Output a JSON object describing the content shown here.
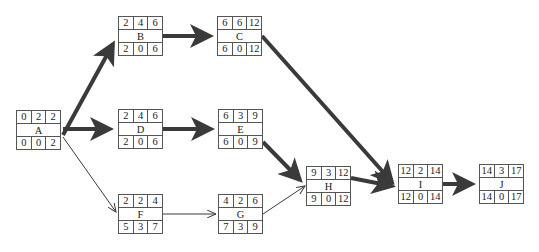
{
  "diagram": {
    "type": "activity-on-node network (critical path)",
    "cell_layout": {
      "top": [
        "ES",
        "Duration",
        "EF"
      ],
      "bottom": [
        "LS",
        "Slack",
        "LF"
      ]
    },
    "colors": {
      "line": "#3a3a3a",
      "critical_edge": "#3a3a3a",
      "border": "#555555",
      "background": "#ffffff"
    },
    "nodes": {
      "A": {
        "label": "A",
        "top": [
          "0",
          "2",
          "2"
        ],
        "bottom": [
          "0",
          "0",
          "2"
        ]
      },
      "B": {
        "label": "B",
        "top": [
          "2",
          "4",
          "6"
        ],
        "bottom": [
          "2",
          "0",
          "6"
        ]
      },
      "C": {
        "label": "C",
        "top": [
          "6",
          "6",
          "12"
        ],
        "bottom": [
          "6",
          "0",
          "12"
        ]
      },
      "D": {
        "label": "D",
        "top": [
          "2",
          "4",
          "6"
        ],
        "bottom": [
          "2",
          "0",
          "6"
        ]
      },
      "E": {
        "label": "E",
        "top": [
          "6",
          "3",
          "9"
        ],
        "bottom": [
          "6",
          "0",
          "9"
        ]
      },
      "F": {
        "label": "F",
        "top": [
          "2",
          "2",
          "4"
        ],
        "bottom": [
          "5",
          "3",
          "7"
        ]
      },
      "G": {
        "label": "G",
        "top": [
          "4",
          "2",
          "6"
        ],
        "bottom": [
          "7",
          "3",
          "9"
        ]
      },
      "H": {
        "label": "H",
        "top": [
          "9",
          "3",
          "12"
        ],
        "bottom": [
          "9",
          "0",
          "12"
        ]
      },
      "I": {
        "label": "I",
        "top": [
          "12",
          "2",
          "14"
        ],
        "bottom": [
          "12",
          "0",
          "14"
        ]
      },
      "J": {
        "label": "J",
        "top": [
          "14",
          "3",
          "17"
        ],
        "bottom": [
          "14",
          "0",
          "17"
        ]
      }
    },
    "edges": [
      {
        "from": "A",
        "to": "B",
        "critical": true
      },
      {
        "from": "A",
        "to": "D",
        "critical": true
      },
      {
        "from": "A",
        "to": "F",
        "critical": false
      },
      {
        "from": "B",
        "to": "C",
        "critical": true
      },
      {
        "from": "C",
        "to": "I",
        "critical": true
      },
      {
        "from": "D",
        "to": "E",
        "critical": true
      },
      {
        "from": "E",
        "to": "H",
        "critical": true
      },
      {
        "from": "F",
        "to": "G",
        "critical": false
      },
      {
        "from": "G",
        "to": "H",
        "critical": false
      },
      {
        "from": "H",
        "to": "I",
        "critical": true
      },
      {
        "from": "I",
        "to": "J",
        "critical": true
      }
    ]
  }
}
